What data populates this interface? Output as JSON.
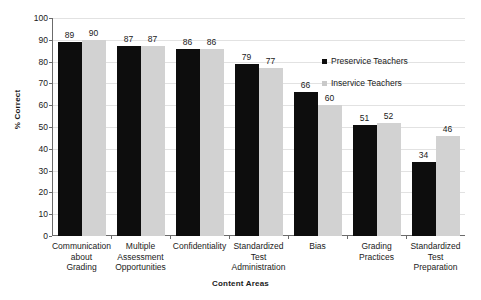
{
  "chart_data": {
    "type": "bar",
    "title": "",
    "xlabel": "Content Areas",
    "ylabel": "% Correct",
    "ylim": [
      0,
      100
    ],
    "ytick_step": 10,
    "yticks": [
      100,
      90,
      80,
      70,
      60,
      50,
      40,
      30,
      20,
      10,
      0
    ],
    "grid": true,
    "legend_position": "inside-upper-right",
    "categories": [
      "Communication about Grading",
      "Multiple Assessment Opportunities",
      "Confidentiality",
      "Standardized Test Administration",
      "Bias",
      "Grading Practices",
      "Standardized Test Preparation"
    ],
    "category_lines": [
      [
        "Communication",
        "about",
        "Grading"
      ],
      [
        "Multiple",
        "Assessment",
        "Opportunities"
      ],
      [
        "Confidentiality"
      ],
      [
        "Standardized",
        "Test",
        "Administration"
      ],
      [
        "Bias"
      ],
      [
        "Grading",
        "Practices"
      ],
      [
        "Standardized",
        "Test",
        "Preparation"
      ]
    ],
    "series": [
      {
        "name": "Preservice Teachers",
        "color": "#0d0d0d",
        "values": [
          89,
          87,
          86,
          79,
          66,
          51,
          34
        ]
      },
      {
        "name": "Inservice Teachers",
        "color": "#d2d2d2",
        "values": [
          90,
          87,
          86,
          77,
          60,
          52,
          46
        ]
      }
    ]
  },
  "legend": {
    "items": [
      {
        "label": "Preservice Teachers"
      },
      {
        "label": "Inservice Teachers"
      }
    ]
  }
}
